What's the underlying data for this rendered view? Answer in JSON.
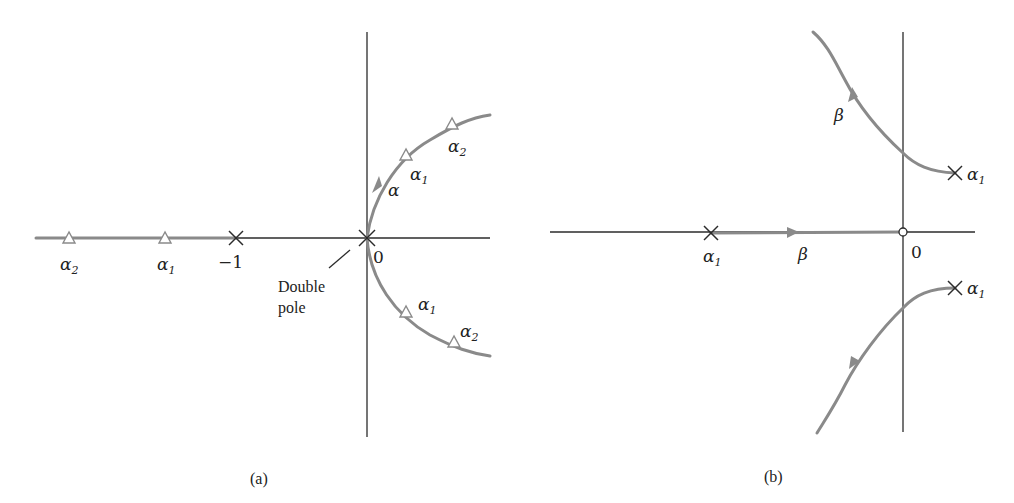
{
  "figure": {
    "panels": [
      {
        "id": "a",
        "caption": "(a)",
        "labels": {
          "alpha": "α",
          "alpha_sub_1": "1",
          "alpha_sub_2": "2",
          "minus_one": "−1",
          "origin": "0",
          "double_pole_line1": "Double",
          "double_pole_line2": "pole",
          "branch_param": "α"
        },
        "markers": {
          "poles": [
            "−1",
            "0 (double pole)"
          ],
          "triangles_real_axis": [
            "α2",
            "α1"
          ],
          "triangles_upper_branch": [
            "α1",
            "α2"
          ],
          "triangles_lower_branch": [
            "α1",
            "α2"
          ]
        }
      },
      {
        "id": "b",
        "caption": "(b)",
        "labels": {
          "alpha": "α",
          "alpha_sub_1": "1",
          "origin": "0",
          "beta": "β"
        },
        "markers": {
          "poles": [
            "α1 (real axis)",
            "α1 (upper)",
            "α1 (lower)"
          ],
          "zero": "0"
        }
      }
    ],
    "colors": {
      "axis": "#2b2b2b",
      "locus": "#8a8a8a",
      "background": "#ffffff"
    }
  }
}
